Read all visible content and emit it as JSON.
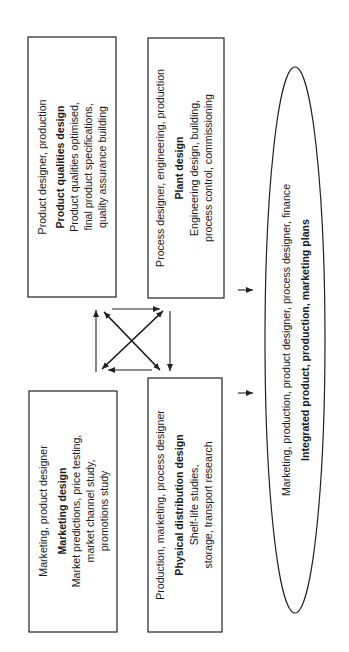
{
  "diagram": {
    "boxes": {
      "marketing": {
        "roles": "Marketing, product designer",
        "title": "Marketing design",
        "lines": [
          "Market predictions, price testing,",
          "market channel study,",
          "promotions study"
        ]
      },
      "product": {
        "roles": "Product designer, production",
        "title": "Product qualities design",
        "lines": [
          "Product qualities optimised,",
          "final product specifications,",
          "quality assurance building"
        ]
      },
      "distribution": {
        "roles": "Production, marketing, process designer",
        "title": "Physical distribution design",
        "lines": [
          "Shelf-life studies,",
          "storage, transport research"
        ]
      },
      "plant": {
        "roles": "Process designer, engineering, production",
        "title": "Plant design",
        "lines": [
          "Engineering design, building,",
          "process control, commissioning"
        ]
      }
    },
    "ellipse": {
      "roles": "Marketing, production, product designer, process designer, finance",
      "title": "Integrated product, production, marketing plans"
    },
    "colors": {
      "stroke": "#222222",
      "text": "#1a1a1a",
      "background": "#ffffff"
    }
  }
}
